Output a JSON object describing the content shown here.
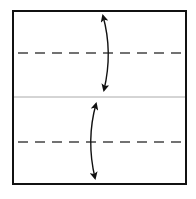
{
  "diagram": {
    "title": "",
    "square": {
      "x": 13,
      "y": 11,
      "width": 173,
      "height": 173,
      "stroke": "#111111"
    },
    "center_line": {
      "y": 97,
      "color": "#aaaaaa"
    },
    "fold_lines": [
      {
        "y": 53,
        "style": "dashed",
        "color": "#444444"
      },
      {
        "y": 142,
        "style": "dashed",
        "color": "#444444"
      }
    ],
    "arrows": [
      {
        "name": "top-fold-arrow",
        "x": 107,
        "y1": 15,
        "y2": 90,
        "bend": "right"
      },
      {
        "name": "bottom-fold-arrow",
        "x": 92,
        "y1": 104,
        "y2": 178,
        "bend": "left"
      }
    ]
  }
}
